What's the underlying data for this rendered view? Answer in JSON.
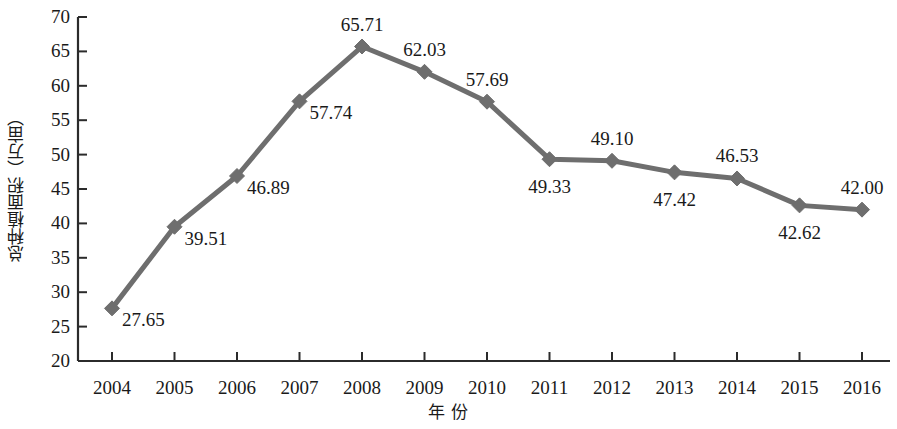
{
  "chart_data": {
    "type": "line",
    "title": "",
    "subtitle": "",
    "xlabel": "年  份",
    "ylabel": "总种植面积（万亩）",
    "categories": [
      "2004",
      "2005",
      "2006",
      "2007",
      "2008",
      "2009",
      "2010",
      "2011",
      "2012",
      "2013",
      "2014",
      "2015",
      "2016"
    ],
    "values": [
      27.65,
      39.51,
      46.89,
      57.74,
      65.71,
      62.03,
      57.69,
      49.33,
      49.1,
      47.42,
      46.53,
      42.62,
      42.0
    ],
    "point_labels": [
      "27.65",
      "39.51",
      "46.89",
      "57.74",
      "65.71",
      "62.03",
      "57.69",
      "49.33",
      "49.10",
      "47.42",
      "46.53",
      "42.62",
      "42.00"
    ],
    "label_positions": [
      "right",
      "right",
      "right",
      "right",
      "above",
      "above",
      "above",
      "below",
      "above",
      "below",
      "above",
      "below",
      "above"
    ],
    "ylim": [
      20,
      70
    ],
    "yticks": [
      20,
      25,
      30,
      35,
      40,
      45,
      50,
      55,
      60,
      65,
      70
    ],
    "ytick_labels": [
      "20",
      "25",
      "30",
      "35",
      "40",
      "45",
      "50",
      "55",
      "60",
      "65",
      "70"
    ],
    "grid": false,
    "legend": false,
    "legend_position": "none",
    "series": [
      {
        "name": "总种植面积",
        "values": [
          27.65,
          39.51,
          46.89,
          57.74,
          65.71,
          62.03,
          57.69,
          49.33,
          49.1,
          47.42,
          46.53,
          42.62,
          42.0
        ],
        "color": "#6e6e6e",
        "marker": "diamond"
      }
    ],
    "colors": {
      "line": "#6e6e6e",
      "marker": "#6e6e6e",
      "axis": "#2b2b2b",
      "text": "#1a1a1a",
      "background": "#ffffff"
    }
  }
}
